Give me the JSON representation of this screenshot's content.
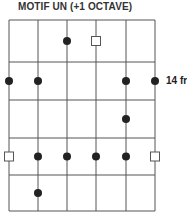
{
  "title": "MOTIF UN (+1 OCTAVE)",
  "fret_label": "14 fr",
  "fret_label_row": 1,
  "colors": {
    "grid": "#555555",
    "dot": "#222222",
    "open_marker": "#555555"
  },
  "grid": {
    "strings_x": [
      9,
      38,
      67,
      96,
      126,
      155
    ],
    "frets_y": [
      20,
      62,
      100,
      138,
      175,
      211
    ]
  },
  "markers": [
    {
      "type": "dot",
      "string": 3,
      "fret": 0
    },
    {
      "type": "square",
      "string": 4,
      "fret": 0
    },
    {
      "type": "dot",
      "string": 1,
      "fret": 1
    },
    {
      "type": "dot",
      "string": 2,
      "fret": 1
    },
    {
      "type": "dot",
      "string": 5,
      "fret": 1
    },
    {
      "type": "dot",
      "string": 6,
      "fret": 1
    },
    {
      "type": "dot",
      "string": 5,
      "fret": 2
    },
    {
      "type": "square",
      "string": 1,
      "fret": 3
    },
    {
      "type": "dot",
      "string": 2,
      "fret": 3
    },
    {
      "type": "dot",
      "string": 3,
      "fret": 3
    },
    {
      "type": "dot",
      "string": 4,
      "fret": 3
    },
    {
      "type": "dot",
      "string": 5,
      "fret": 3
    },
    {
      "type": "square",
      "string": 6,
      "fret": 3
    },
    {
      "type": "dot",
      "string": 2,
      "fret": 4
    }
  ]
}
